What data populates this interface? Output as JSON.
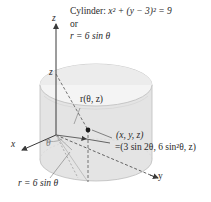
{
  "figure": {
    "title_line1_prefix": "Cylinder: ",
    "title_eq": "x² + (y − 3)² = 9",
    "title_line2": "or",
    "title_line3": "r = 6 sin θ",
    "axis_z": "z",
    "axis_x": "x",
    "axis_y": "y",
    "z_height_label": "z",
    "theta_label": "θ",
    "vector_label": "r(θ, z)",
    "point_label_line1": "(x, y, z)",
    "point_label_line2": "=(3 sin 2θ, 6 sin²θ, z)",
    "base_curve_label": "r = 6 sin θ"
  },
  "colors": {
    "cylinder_fill": "#e4e4e4",
    "cylinder_inner": "#f2f2f2",
    "cylinder_edge": "#bdbdbd",
    "axis": "#3a3a3a",
    "point": "#1a1a1a",
    "dashed": "#555555"
  }
}
